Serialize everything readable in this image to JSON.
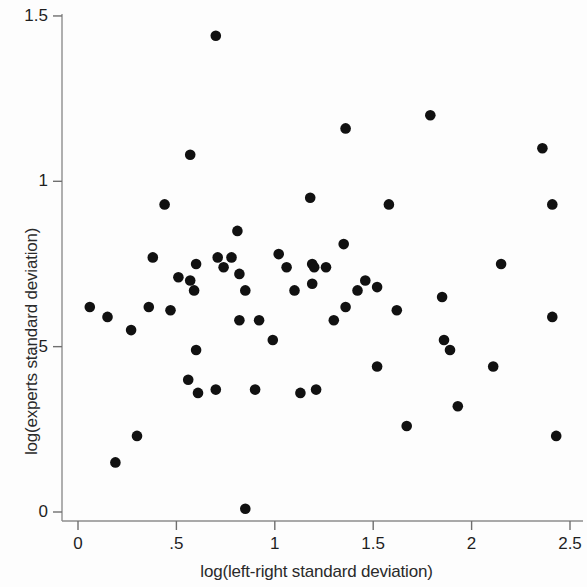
{
  "chart_data": {
    "type": "scatter",
    "title": "",
    "xlabel": "log(left-right standard deviation)",
    "ylabel": "log(experts standard deviation)",
    "xlim": [
      -0.08,
      2.6
    ],
    "ylim": [
      -0.05,
      1.55
    ],
    "xticks": [
      0,
      0.5,
      1,
      1.5,
      2,
      2.5
    ],
    "xticklabels": [
      "0",
      ".5",
      "1",
      "1.5",
      "2",
      "2.5"
    ],
    "yticks": [
      0,
      0.5,
      1,
      1.5
    ],
    "yticklabels": [
      "0",
      ".5",
      "1",
      "1.5"
    ],
    "grid": false,
    "legend": null,
    "marker": {
      "shape": "circle",
      "color": "#111111",
      "size": 9
    },
    "points": [
      {
        "x": 0.06,
        "y": 0.62
      },
      {
        "x": 0.15,
        "y": 0.59
      },
      {
        "x": 0.19,
        "y": 0.15
      },
      {
        "x": 0.27,
        "y": 0.55
      },
      {
        "x": 0.3,
        "y": 0.23
      },
      {
        "x": 0.36,
        "y": 0.62
      },
      {
        "x": 0.38,
        "y": 0.77
      },
      {
        "x": 0.44,
        "y": 0.93
      },
      {
        "x": 0.47,
        "y": 0.61
      },
      {
        "x": 0.51,
        "y": 0.71
      },
      {
        "x": 0.56,
        "y": 0.4
      },
      {
        "x": 0.57,
        "y": 1.08
      },
      {
        "x": 0.57,
        "y": 0.7
      },
      {
        "x": 0.59,
        "y": 0.67
      },
      {
        "x": 0.6,
        "y": 0.75
      },
      {
        "x": 0.6,
        "y": 0.49
      },
      {
        "x": 0.61,
        "y": 0.36
      },
      {
        "x": 0.7,
        "y": 1.44
      },
      {
        "x": 0.7,
        "y": 0.37
      },
      {
        "x": 0.71,
        "y": 0.77
      },
      {
        "x": 0.74,
        "y": 0.74
      },
      {
        "x": 0.78,
        "y": 0.77
      },
      {
        "x": 0.81,
        "y": 0.85
      },
      {
        "x": 0.82,
        "y": 0.72
      },
      {
        "x": 0.82,
        "y": 0.58
      },
      {
        "x": 0.85,
        "y": 0.67
      },
      {
        "x": 0.85,
        "y": 0.01
      },
      {
        "x": 0.9,
        "y": 0.37
      },
      {
        "x": 0.92,
        "y": 0.58
      },
      {
        "x": 0.99,
        "y": 0.52
      },
      {
        "x": 1.02,
        "y": 0.78
      },
      {
        "x": 1.06,
        "y": 0.74
      },
      {
        "x": 1.1,
        "y": 0.67
      },
      {
        "x": 1.13,
        "y": 0.36
      },
      {
        "x": 1.18,
        "y": 0.95
      },
      {
        "x": 1.19,
        "y": 0.75
      },
      {
        "x": 1.19,
        "y": 0.69
      },
      {
        "x": 1.2,
        "y": 0.74
      },
      {
        "x": 1.21,
        "y": 0.37
      },
      {
        "x": 1.26,
        "y": 0.74
      },
      {
        "x": 1.3,
        "y": 0.58
      },
      {
        "x": 1.35,
        "y": 0.81
      },
      {
        "x": 1.36,
        "y": 1.16
      },
      {
        "x": 1.36,
        "y": 0.62
      },
      {
        "x": 1.42,
        "y": 0.67
      },
      {
        "x": 1.46,
        "y": 0.7
      },
      {
        "x": 1.52,
        "y": 0.68
      },
      {
        "x": 1.52,
        "y": 0.44
      },
      {
        "x": 1.58,
        "y": 0.93
      },
      {
        "x": 1.62,
        "y": 0.61
      },
      {
        "x": 1.67,
        "y": 0.26
      },
      {
        "x": 1.79,
        "y": 1.2
      },
      {
        "x": 1.85,
        "y": 0.65
      },
      {
        "x": 1.86,
        "y": 0.52
      },
      {
        "x": 1.89,
        "y": 0.49
      },
      {
        "x": 1.93,
        "y": 0.32
      },
      {
        "x": 2.11,
        "y": 0.44
      },
      {
        "x": 2.15,
        "y": 0.75
      },
      {
        "x": 2.36,
        "y": 1.1
      },
      {
        "x": 2.41,
        "y": 0.93
      },
      {
        "x": 2.41,
        "y": 0.59
      },
      {
        "x": 2.43,
        "y": 0.23
      }
    ]
  }
}
